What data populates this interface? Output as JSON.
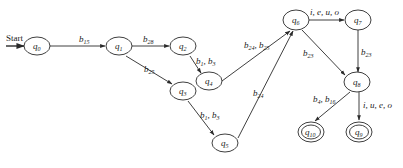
{
  "diagram": {
    "type": "finite-state-automaton",
    "start_label": "Start",
    "colors": {
      "stroke": "#2a2a2a",
      "text": "#222222",
      "background": "#ffffff"
    },
    "nodes": [
      {
        "id": "q0",
        "base": "q",
        "sub": "0",
        "cx": 37,
        "cy": 46,
        "accepting": false
      },
      {
        "id": "q1",
        "base": "q",
        "sub": "1",
        "cx": 119,
        "cy": 46,
        "accepting": false
      },
      {
        "id": "q2",
        "base": "q",
        "sub": "2",
        "cx": 183,
        "cy": 46,
        "accepting": false
      },
      {
        "id": "q3",
        "base": "q",
        "sub": "3",
        "cx": 183,
        "cy": 91,
        "accepting": false
      },
      {
        "id": "q4",
        "base": "q",
        "sub": "4",
        "cx": 209,
        "cy": 81,
        "accepting": false
      },
      {
        "id": "q5",
        "base": "q",
        "sub": "5",
        "cx": 225,
        "cy": 143,
        "accepting": false
      },
      {
        "id": "q6",
        "base": "q",
        "sub": "6",
        "cx": 296,
        "cy": 20,
        "accepting": false
      },
      {
        "id": "q7",
        "base": "q",
        "sub": "7",
        "cx": 358,
        "cy": 20,
        "accepting": false
      },
      {
        "id": "q8",
        "base": "q",
        "sub": "8",
        "cx": 357,
        "cy": 82,
        "accepting": false
      },
      {
        "id": "q9",
        "base": "q",
        "sub": "9",
        "cx": 359,
        "cy": 132,
        "accepting": true
      },
      {
        "id": "q10",
        "base": "q",
        "sub": "10",
        "cx": 311,
        "cy": 132,
        "accepting": true
      }
    ],
    "edges": [
      {
        "from": "q0",
        "to": "q1",
        "label": "b15"
      },
      {
        "from": "q1",
        "to": "q2",
        "label": "b28"
      },
      {
        "from": "q1",
        "to": "q3",
        "label": "b25"
      },
      {
        "from": "q2",
        "to": "q4",
        "label": "b1, b3"
      },
      {
        "from": "q3",
        "to": "q5",
        "label": "b1, b3"
      },
      {
        "from": "q4",
        "to": "q6",
        "label": "b24, b25"
      },
      {
        "from": "q5",
        "to": "q6",
        "label": "b24"
      },
      {
        "from": "q6",
        "to": "q7",
        "label": "i, e, u, o"
      },
      {
        "from": "q6",
        "to": "q8",
        "label": "b23"
      },
      {
        "from": "q7",
        "to": "q8",
        "label": "b23"
      },
      {
        "from": "q8",
        "to": "q10",
        "label": "b4, b16"
      },
      {
        "from": "q8",
        "to": "q9",
        "label": "i, u, e, o"
      }
    ]
  }
}
